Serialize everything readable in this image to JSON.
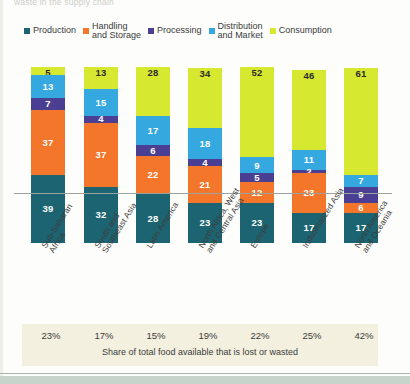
{
  "top_cut_text": "waste in the supply chain",
  "colors": {
    "production": "#1c6471",
    "handling": "#f4762a",
    "processing": "#4b3f93",
    "distribution": "#35a8e0",
    "consumption": "#d7e831",
    "caption_bg": "#f4f0e0",
    "axis": "#9aa3a0",
    "text": "#3b3b3b"
  },
  "chart_data": {
    "type": "bar",
    "title": "",
    "xlabel": "",
    "ylabel": "",
    "stacked": true,
    "grid": false,
    "legend_position": "top",
    "ylim": [
      0,
      110
    ],
    "categories": [
      "Sub-Saharan\nAfrica",
      "South and\nSoutheast Asia",
      "Latin America",
      "North Africa, West\nand Central Asia",
      "Europe",
      "Industrialized Asia",
      "North America\nand Oceania"
    ],
    "series": [
      {
        "name": "Production",
        "color": "#1c6471",
        "values": [
          39,
          32,
          28,
          23,
          23,
          17,
          17
        ]
      },
      {
        "name": "Handling\nand Storage",
        "color": "#f4762a",
        "values": [
          37,
          37,
          22,
          21,
          12,
          23,
          6
        ]
      },
      {
        "name": "Processing",
        "color": "#4b3f93",
        "values": [
          7,
          4,
          6,
          4,
          5,
          2,
          9
        ]
      },
      {
        "name": "Distribution\nand Market",
        "color": "#35a8e0",
        "values": [
          13,
          15,
          17,
          18,
          9,
          11,
          7
        ]
      },
      {
        "name": "Consumption",
        "color": "#d7e831",
        "values": [
          5,
          13,
          28,
          34,
          52,
          46,
          61
        ]
      }
    ],
    "annotations": {
      "share_values": [
        "23%",
        "17%",
        "15%",
        "19%",
        "22%",
        "25%",
        "42%"
      ],
      "share_caption": "Share of total food available that is lost or wasted"
    }
  }
}
